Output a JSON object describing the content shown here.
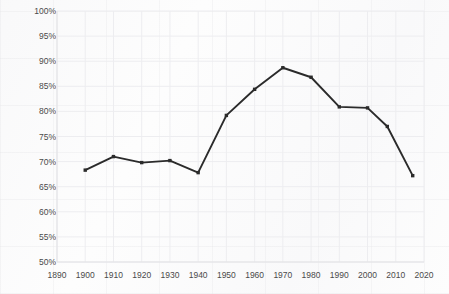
{
  "chart_data": {
    "type": "line",
    "title": "",
    "xlabel": "",
    "ylabel": "Young adults (25–29) living on their own",
    "xlim": [
      1890,
      2020
    ],
    "ylim": [
      50,
      100
    ],
    "grid": true,
    "legend": null,
    "xticks": [
      "1890",
      "1900",
      "1910",
      "1920",
      "1930",
      "1940",
      "1950",
      "1960",
      "1970",
      "1980",
      "1990",
      "2000",
      "2010",
      "2020"
    ],
    "yticks": [
      "50%",
      "55%",
      "60%",
      "65%",
      "70%",
      "75%",
      "80%",
      "85%",
      "90%",
      "95%",
      "100%"
    ],
    "xtick_values": [
      1890,
      1900,
      1910,
      1920,
      1930,
      1940,
      1950,
      1960,
      1970,
      1980,
      1990,
      2000,
      2010,
      2020
    ],
    "ytick_values": [
      50,
      55,
      60,
      65,
      70,
      75,
      80,
      85,
      90,
      95,
      100
    ],
    "line_color": "#2b2b2b",
    "marker": "square",
    "series": [
      {
        "name": "Young adults (25–29) living on their own",
        "x": [
          1900,
          1910,
          1920,
          1930,
          1940,
          1950,
          1960,
          1970,
          1980,
          1990,
          2000,
          2007,
          2016
        ],
        "values": [
          68.3,
          71.0,
          69.8,
          70.2,
          67.8,
          79.2,
          84.4,
          88.7,
          86.8,
          80.9,
          80.7,
          77.0,
          67.2
        ]
      }
    ]
  },
  "colors": {
    "line": "#2b2b2b",
    "grid": "#ededf0",
    "text": "#3f3f3f",
    "background": "#fdfdfd"
  }
}
